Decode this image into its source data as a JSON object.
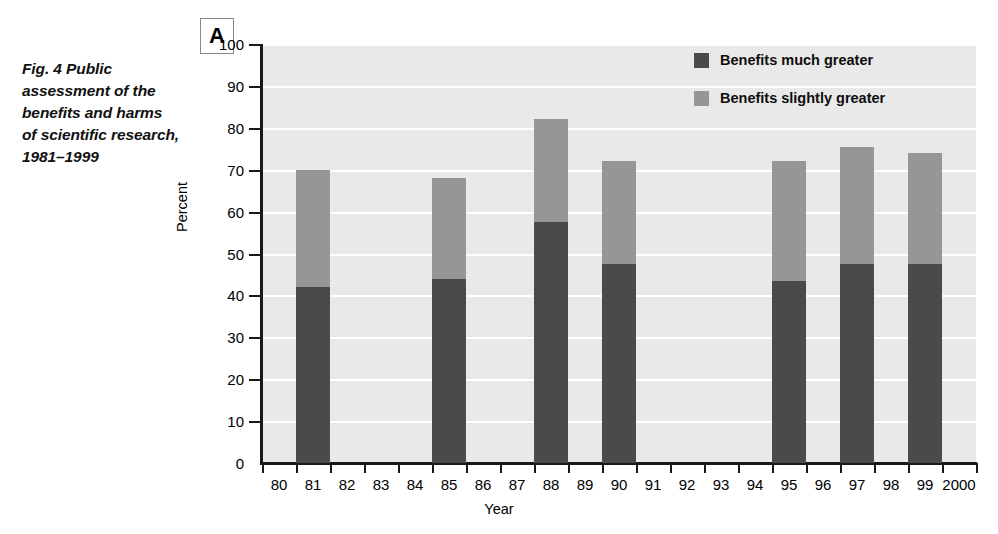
{
  "caption": {
    "lines": [
      "Fig. 4 Public",
      "assessment of the",
      "benefits and harms",
      "of scientific research,",
      "1981–1999"
    ]
  },
  "panel_label": "A",
  "colors": {
    "much_greater": "#4a4a4a",
    "slightly_greater": "#969696",
    "plot_background": "#e9e9e9",
    "gridline": "#ffffff",
    "axis": "#1a1a1a",
    "text": "#000000"
  },
  "chart_data": {
    "type": "bar",
    "subtype": "stacked",
    "title": "",
    "xlabel": "Year",
    "ylabel": "Percent",
    "ylim": [
      0,
      100
    ],
    "yticks": [
      0,
      10,
      20,
      30,
      40,
      50,
      60,
      70,
      80,
      90,
      100
    ],
    "grid": true,
    "legend_position": "top-right",
    "categories": [
      "80",
      "81",
      "82",
      "83",
      "84",
      "85",
      "86",
      "87",
      "88",
      "89",
      "90",
      "91",
      "92",
      "93",
      "94",
      "95",
      "96",
      "97",
      "98",
      "99",
      "2000"
    ],
    "series": [
      {
        "name": "Benefits much greater",
        "color": "#4a4a4a",
        "values": [
          null,
          42,
          null,
          null,
          null,
          44,
          null,
          null,
          57.5,
          null,
          47.5,
          null,
          null,
          null,
          null,
          43.5,
          null,
          47.5,
          null,
          47.5,
          null
        ]
      },
      {
        "name": "Benefits slightly greater",
        "color": "#969696",
        "values": [
          null,
          28,
          null,
          null,
          null,
          24,
          null,
          null,
          24.5,
          null,
          24.5,
          null,
          null,
          null,
          null,
          28.5,
          null,
          28,
          null,
          26.5,
          null
        ]
      }
    ],
    "totals": [
      null,
      70,
      null,
      null,
      null,
      68,
      null,
      null,
      82,
      null,
      72,
      null,
      null,
      null,
      null,
      72,
      null,
      75.5,
      null,
      74,
      null
    ],
    "annotations": []
  },
  "legend": {
    "items": [
      {
        "label": "Benefits much greater",
        "color": "#4a4a4a"
      },
      {
        "label": "Benefits slightly greater",
        "color": "#969696"
      }
    ]
  }
}
